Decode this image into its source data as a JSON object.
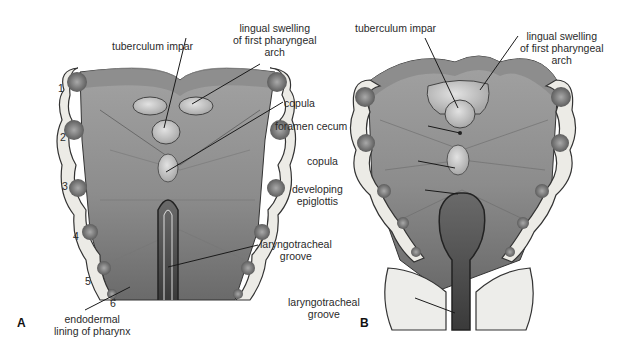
{
  "figure": {
    "panels": [
      {
        "id": "A",
        "letter": "A",
        "arch_numbers": [
          "1",
          "2",
          "3",
          "4",
          "5",
          "6"
        ],
        "labels": {
          "tuberculum_impar": "tuberculum impar",
          "lingual_swelling": [
            "lingual swelling",
            "of first pharyngeal",
            "arch"
          ],
          "copula": "copula",
          "laryngotracheal_groove": [
            "laryngotracheal",
            "groove"
          ],
          "endodermal_lining": [
            "endodermal",
            "lining of pharynx"
          ]
        }
      },
      {
        "id": "B",
        "letter": "B",
        "labels": {
          "tuberculum_impar": "tuberculum impar",
          "lingual_swelling": [
            "lingual swelling",
            "of first pharyngeal",
            "arch"
          ],
          "foramen_cecum": "foramen cecum",
          "copula": "copula",
          "developing_epiglottis": [
            "developing",
            "epiglottis"
          ],
          "laryngotracheal_groove": [
            "laryngotracheal",
            "groove"
          ]
        }
      }
    ],
    "colors": {
      "tissue_light": "#b8b8b8",
      "tissue_mid": "#9a9a9a",
      "tissue_dark": "#5a5a5a",
      "rim": "#8e8e8e",
      "arch_fill": "#ecebe6",
      "nodule": "#7a7a7a",
      "line": "#1a1a1a"
    }
  }
}
